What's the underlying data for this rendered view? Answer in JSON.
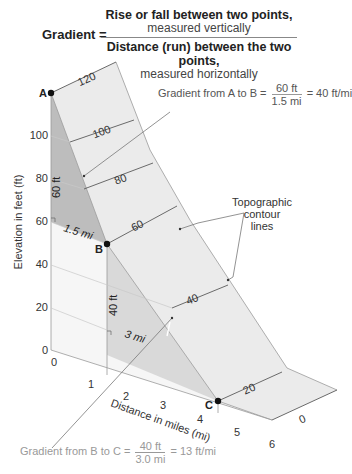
{
  "formula": {
    "label": "Gradient =",
    "numerator_bold": "Rise or fall between two points,",
    "numerator_sub": "measured vertically",
    "denominator_bold": "Distance (run) between the two points,",
    "denominator_sub": "measured horizontally"
  },
  "points": {
    "a": "A",
    "b": "B",
    "c": "C"
  },
  "contours": [
    "120",
    "100",
    "80",
    "60",
    "40",
    "20",
    "0"
  ],
  "y_axis": {
    "title": "Elevation in feet (ft)",
    "ticks": [
      "0",
      "20",
      "40",
      "60",
      "80",
      "100"
    ]
  },
  "x_axis": {
    "title": "Distance in miles (mi)",
    "ticks": [
      "0",
      "1",
      "2",
      "3",
      "4",
      "5",
      "6"
    ]
  },
  "measurements": {
    "ab_rise": "60 ft",
    "ab_run": "1.5 mi",
    "bc_rise": "40 ft",
    "bc_run": "3 mi"
  },
  "gradient_ab": {
    "prefix": "Gradient from A to B =",
    "numerator": "60 ft",
    "denominator": "1.5 mi",
    "result": "= 40 ft/mi"
  },
  "gradient_bc": {
    "prefix": "Gradient from B to C =",
    "numerator": "40 ft",
    "denominator": "3.0 mi",
    "result": "= 13 ft/mi"
  },
  "callout": {
    "line1": "Topographic",
    "line2": "contour",
    "line3": "lines"
  },
  "colors": {
    "slope_surface": "#ebebeb",
    "steep_triangle": "#bdbdbd",
    "gentle_triangle": "#d9d9d9",
    "base_face": "#f6f6f6",
    "lines": "#7a7a7a"
  }
}
